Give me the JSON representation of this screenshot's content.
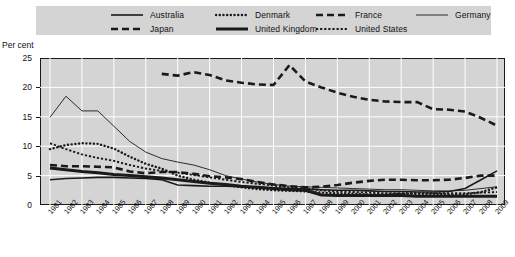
{
  "legend": {
    "entries": [
      {
        "label": "Australia",
        "style": "solid-thin",
        "row": 1,
        "x": 150
      },
      {
        "label": "Denmark",
        "style": "dotted-round",
        "row": 1,
        "x": 255
      },
      {
        "label": "France",
        "style": "dashed-thick",
        "row": 1,
        "x": 355
      },
      {
        "label": "Germany",
        "style": "solid-hair",
        "row": 1,
        "x": 455
      },
      {
        "label": "Japan",
        "style": "dashed-thick",
        "row": 2,
        "x": 150
      },
      {
        "label": "United Kingdom",
        "style": "solid-thick",
        "row": 2,
        "x": 255
      },
      {
        "label": "United States",
        "style": "dotted-fine",
        "row": 2,
        "x": 355
      }
    ]
  },
  "axis": {
    "units_label": "Per cent",
    "y_ticks": [
      "25",
      "20",
      "15",
      "10",
      "5",
      "0"
    ],
    "x_ticks": [
      "1981",
      "1982",
      "1983",
      "1984",
      "1985",
      "1986",
      "1987",
      "1988",
      "1989",
      "1990",
      "1991",
      "1992",
      "1993",
      "1994",
      "1995",
      "1996",
      "1997",
      "1998",
      "1999",
      "2000",
      "2001",
      "2002",
      "2003",
      "2004",
      "2005",
      "2006",
      "2007",
      "2008",
      "2009"
    ]
  },
  "colors": {
    "plot_background": "#d4d4d4",
    "legend_background": "#d4d4d4",
    "gridline": "#ffffff",
    "line": "#1a1a1a",
    "axis": "#1a1a1a",
    "text": "#111111"
  },
  "chart_data": {
    "type": "line",
    "title": "",
    "subtitle": "",
    "xlabel": "",
    "ylabel": "Per cent",
    "ylim": [
      0,
      25
    ],
    "y_ticks": [
      0,
      5,
      10,
      15,
      20,
      25
    ],
    "grid": true,
    "legend_position": "top",
    "x": [
      1981,
      1982,
      1983,
      1984,
      1985,
      1986,
      1987,
      1988,
      1989,
      1990,
      1991,
      1992,
      1993,
      1994,
      1995,
      1996,
      1997,
      1998,
      1999,
      2000,
      2001,
      2002,
      2003,
      2004,
      2005,
      2006,
      2007,
      2008,
      2009
    ],
    "series": [
      {
        "name": "Australia",
        "style": "solid-thin",
        "values": [
          4.3,
          4.5,
          4.6,
          4.7,
          4.7,
          4.6,
          4.5,
          4.3,
          3.4,
          3.3,
          3.2,
          3.2,
          3.1,
          3.0,
          2.9,
          2.8,
          2.7,
          2.6,
          2.5,
          2.5,
          2.4,
          2.3,
          2.3,
          2.2,
          2.2,
          2.3,
          2.8,
          4.3,
          5.8
        ]
      },
      {
        "name": "Denmark",
        "style": "dotted-round",
        "values": [
          9.5,
          10.2,
          10.5,
          10.4,
          9.6,
          8.2,
          7.0,
          6.2,
          5.0,
          4.3,
          3.8,
          3.4,
          3.0,
          2.7,
          2.5,
          2.4,
          2.3,
          2.1,
          2.0,
          1.9,
          1.8,
          1.8,
          1.9,
          1.9,
          1.9,
          1.8,
          1.8,
          2.2,
          3.0
        ]
      },
      {
        "name": "France",
        "style": "dashed-thick",
        "values": [
          6.8,
          6.6,
          6.6,
          6.5,
          6.4,
          5.7,
          5.4,
          5.6,
          5.6,
          5.3,
          4.9,
          4.7,
          4.4,
          3.9,
          3.5,
          3.2,
          3.0,
          3.1,
          3.4,
          3.8,
          4.1,
          4.3,
          4.3,
          4.2,
          4.2,
          4.3,
          4.6,
          5.0,
          5.0
        ]
      },
      {
        "name": "Germany",
        "style": "solid-hair",
        "values": [
          14.9,
          18.5,
          16.0,
          16.0,
          13.4,
          10.8,
          9.0,
          7.9,
          7.3,
          6.8,
          6.0,
          5.0,
          4.4,
          3.9,
          3.5,
          3.2,
          3.1,
          3.0,
          2.9,
          2.8,
          2.7,
          2.6,
          2.6,
          2.5,
          2.4,
          2.4,
          2.5,
          2.8,
          3.1
        ]
      },
      {
        "name": "Japan",
        "style": "dashed-thick",
        "values": [
          null,
          null,
          null,
          null,
          null,
          null,
          null,
          22.3,
          22.0,
          22.6,
          22.1,
          21.2,
          20.8,
          20.5,
          20.4,
          23.8,
          21.0,
          20.0,
          19.1,
          18.4,
          17.9,
          17.6,
          17.5,
          17.5,
          16.3,
          16.2,
          15.9,
          14.8,
          13.5
        ]
      },
      {
        "name": "United Kingdom",
        "style": "solid-thick",
        "values": [
          6.3,
          6.0,
          5.7,
          5.5,
          5.2,
          5.0,
          4.8,
          4.6,
          4.3,
          4.0,
          3.7,
          3.5,
          3.2,
          3.0,
          2.8,
          2.6,
          2.5,
          1.7,
          1.6,
          1.6,
          1.6,
          1.6,
          1.6,
          1.5,
          1.5,
          1.5,
          1.5,
          1.5,
          1.5
        ]
      },
      {
        "name": "United States",
        "style": "dotted-fine",
        "values": [
          10.5,
          9.5,
          8.6,
          8.0,
          7.5,
          6.8,
          6.2,
          5.8,
          5.5,
          5.1,
          4.7,
          4.3,
          3.9,
          3.6,
          3.3,
          3.0,
          2.8,
          2.5,
          2.3,
          2.2,
          2.1,
          2.0,
          2.0,
          2.0,
          2.0,
          2.0,
          2.0,
          2.1,
          2.2
        ]
      }
    ]
  }
}
